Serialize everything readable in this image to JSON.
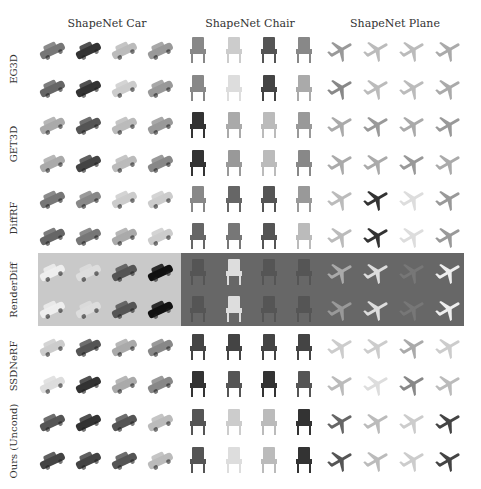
{
  "figure": {
    "column_titles": [
      "ShapeNet Car",
      "ShapeNet Chair",
      "ShapeNet Plane"
    ],
    "row_labels": [
      "EG3D",
      "GET3D",
      "DiffRF",
      "RenderDiff",
      "SSDNeRF",
      "Ours (Uncond)"
    ],
    "samples_per_row_per_category": 4,
    "rows_per_method": 2,
    "background_colors": {
      "page": "#ffffff",
      "renderdiff_car": "#c9c9c9",
      "renderdiff_chair_plane": "#676767"
    }
  },
  "grid": {
    "col_x": [
      52,
      88,
      124,
      160,
      198,
      234,
      269,
      304,
      341,
      377,
      413,
      449
    ],
    "row_y": [
      50,
      88,
      125,
      163,
      199,
      236,
      272,
      309,
      347,
      384,
      422,
      460
    ],
    "categories": [
      "car",
      "car",
      "car",
      "car",
      "chair",
      "chair",
      "chair",
      "chair",
      "plane",
      "plane",
      "plane",
      "plane"
    ],
    "tones": [
      [
        "#777",
        "#333",
        "#bbb",
        "#999",
        "#888",
        "#ccc",
        "#555",
        "#888",
        "#999",
        "#bbb",
        "#bbb",
        "#aaa"
      ],
      [
        "#666",
        "#333",
        "#ccc",
        "#999",
        "#888",
        "#ddd",
        "#444",
        "#aaa",
        "#888",
        "#bbb",
        "#bbb",
        "#aaa"
      ],
      [
        "#aaa",
        "#555",
        "#bbb",
        "#999",
        "#333",
        "#aaa",
        "#bbb",
        "#999",
        "#aaa",
        "#999",
        "#aaa",
        "#999"
      ],
      [
        "#aaa",
        "#444",
        "#bbb",
        "#888",
        "#333",
        "#999",
        "#bbb",
        "#888",
        "#aaa",
        "#aaa",
        "#999",
        "#aaa"
      ],
      [
        "#777",
        "#888",
        "#ccc",
        "#ccc",
        "#888",
        "#666",
        "#555",
        "#999",
        "#bbb",
        "#333",
        "#ddd",
        "#999"
      ],
      [
        "#666",
        "#777",
        "#aaa",
        "#ccc",
        "#666",
        "#777",
        "#555",
        "#bbb",
        "#bbb",
        "#333",
        "#ddd",
        "#999"
      ],
      [
        "#eee",
        "#ddd",
        "#555",
        "#111",
        "#555",
        "#ddd",
        "#555",
        "#555",
        "#aaa",
        "#ddd",
        "#777",
        "#eee"
      ],
      [
        "#eee",
        "#ddd",
        "#555",
        "#111",
        "#555",
        "#ddd",
        "#555",
        "#555",
        "#999",
        "#ddd",
        "#777",
        "#eee"
      ],
      [
        "#ccc",
        "#555",
        "#aaa",
        "#888",
        "#444",
        "#444",
        "#444",
        "#444",
        "#ccc",
        "#ccc",
        "#aaa",
        "#ccc"
      ],
      [
        "#ddd",
        "#333",
        "#aaa",
        "#888",
        "#333",
        "#555",
        "#333",
        "#555",
        "#bbb",
        "#ddd",
        "#888",
        "#bbb"
      ],
      [
        "#555",
        "#333",
        "#555",
        "#bbb",
        "#555",
        "#ccc",
        "#bbb",
        "#333",
        "#666",
        "#bbb",
        "#ccc",
        "#444"
      ],
      [
        "#444",
        "#444",
        "#555",
        "#bbb",
        "#555",
        "#ddd",
        "#bbb",
        "#333",
        "#555",
        "#bbb",
        "#ccc",
        "#444"
      ]
    ]
  }
}
